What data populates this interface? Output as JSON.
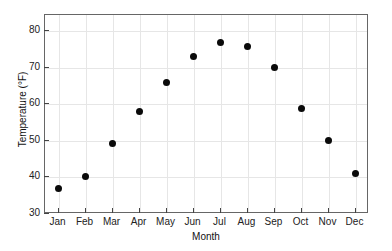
{
  "chart_data": {
    "type": "scatter",
    "title": "",
    "xlabel": "Month",
    "ylabel": "Temperature (°F)",
    "categories": [
      "Jan",
      "Feb",
      "Mar",
      "Apr",
      "May",
      "Jun",
      "Jul",
      "Aug",
      "Sep",
      "Oct",
      "Nov",
      "Dec"
    ],
    "values": [
      37,
      40.4,
      49.2,
      58,
      66,
      73.2,
      77,
      76,
      70,
      59,
      50,
      41.2
    ],
    "series": [
      {
        "name": "Temperature",
        "values": [
          37,
          40.4,
          49.2,
          58,
          66,
          73.2,
          77,
          76,
          70,
          59,
          50,
          41.2
        ]
      }
    ],
    "ylim": [
      30,
      84.5
    ],
    "yticks": [
      30,
      40,
      50,
      60,
      70,
      80
    ],
    "ytick_labels": [
      "30",
      "40",
      "50",
      "60",
      "70",
      "80"
    ],
    "xtick_labels": [
      "Jan",
      "Feb",
      "Mar",
      "Apr",
      "May",
      "Jun",
      "Jul",
      "Aug",
      "Sep",
      "Oct",
      "Nov",
      "Dec"
    ],
    "grid": true,
    "legend": false,
    "marker_color": "#0a0a0a",
    "marker_shape": "circle",
    "grid_color": "#e6e6e6",
    "axis_color": "#666666",
    "background": "#ffffff"
  }
}
